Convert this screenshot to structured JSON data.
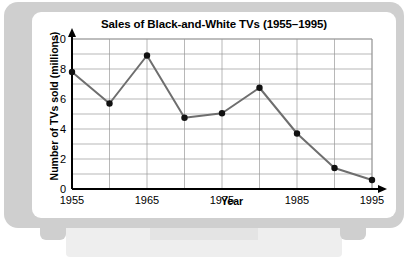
{
  "chart_data": {
    "type": "line",
    "title": "Sales of Black-and-White TVs (1955–1995)",
    "xlabel": "Year",
    "ylabel": "Number of TVs sold (millions)",
    "x": [
      1955,
      1960,
      1965,
      1970,
      1975,
      1980,
      1985,
      1990,
      1995
    ],
    "values": [
      7.8,
      5.7,
      8.9,
      4.75,
      5.05,
      6.75,
      3.7,
      1.4,
      0.6
    ],
    "series": [
      {
        "name": "Number of TVs sold (millions)",
        "values": [
          7.8,
          5.7,
          8.9,
          4.75,
          5.05,
          6.75,
          3.7,
          1.4,
          0.6
        ]
      }
    ],
    "xlim": [
      1955,
      1995
    ],
    "ylim": [
      0,
      10
    ],
    "xticks": [
      1955,
      1965,
      1975,
      1985,
      1995
    ],
    "xtick_labels": [
      "1955",
      "1965",
      "1975",
      "1985",
      "1995"
    ],
    "yticks": [
      0,
      2,
      4,
      6,
      8,
      10
    ],
    "ytick_labels": [
      "0",
      "2",
      "4",
      "6",
      "8",
      "10"
    ],
    "y_gridline_step": 1,
    "x_gridline_step": 5,
    "grid": true,
    "legend": false,
    "line_color": "#6e6e6e",
    "marker_color": "#111111",
    "grid_color": "#999999",
    "axis_color": "#000000"
  },
  "frame": {
    "bezel_color": "#cfcfcf",
    "screen_color": "#ffffff",
    "stand_color": "#eeeeee"
  }
}
